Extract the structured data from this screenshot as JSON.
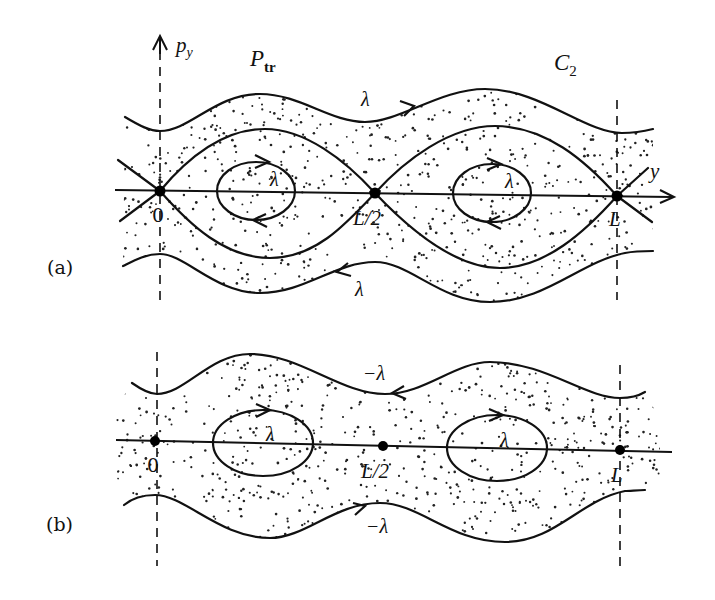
{
  "figure": {
    "panels": [
      {
        "id": "a",
        "label": "(a)",
        "label_pos": [
          62,
          274
        ],
        "top_labels": {
          "axis_label": "p",
          "axis_label_sub": "y",
          "left_label": "P",
          "left_label_sub": "tr",
          "right_label": "C",
          "right_label_sub": "2"
        },
        "horizontal_axis_label": "y",
        "points": [
          {
            "name": "0",
            "x": 160,
            "y": 191
          },
          {
            "name": "L/2",
            "x": 375,
            "y": 193
          },
          {
            "name": "L",
            "x": 617,
            "y": 196
          }
        ],
        "orbit_labels": [
          {
            "text": "λ",
            "x": 368,
            "y": 104,
            "where": "outer-top"
          },
          {
            "text": "λ",
            "x": 276,
            "y": 180,
            "where": "left-island"
          },
          {
            "text": "λ",
            "x": 512,
            "y": 184,
            "where": "right-island"
          },
          {
            "text": "λ",
            "x": 361,
            "y": 292,
            "where": "outer-bottom"
          }
        ]
      },
      {
        "id": "b",
        "label": "(b)",
        "label_pos": [
          62,
          531
        ],
        "points": [
          {
            "name": "0",
            "x": 155,
            "y": 441
          },
          {
            "name": "L/2",
            "x": 383,
            "y": 446
          },
          {
            "name": "L",
            "x": 620,
            "y": 450
          }
        ],
        "orbit_labels": [
          {
            "text": "−λ",
            "x": 374,
            "y": 378,
            "where": "outer-top"
          },
          {
            "text": "λ",
            "x": 272,
            "y": 439,
            "where": "left-island"
          },
          {
            "text": "λ",
            "x": 506,
            "y": 445,
            "where": "right-island"
          },
          {
            "text": "−λ",
            "x": 376,
            "y": 532,
            "where": "outer-bottom"
          }
        ]
      }
    ],
    "colors": {
      "ink": "#111111",
      "background": "#ffffff"
    }
  }
}
